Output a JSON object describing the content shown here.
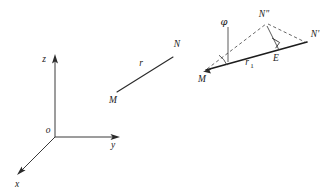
{
  "figure": {
    "background_color": "#ffffff",
    "ink_color": "#1c1c1c"
  },
  "panels": [
    {
      "id": "coordinate-axes",
      "name": "cartesian-coordinate-system",
      "labels": {
        "origin": "o",
        "z_axis": "z",
        "y_axis": "y",
        "x_axis": "x"
      }
    },
    {
      "id": "vector-segment",
      "name": "segment-m-n",
      "labels": {
        "start_point": "M",
        "end_point": "N",
        "segment": "r"
      }
    },
    {
      "id": "projection-triangle",
      "name": "triangle-m-nprime-ndoubleprime",
      "labels": {
        "vertex_left": "M",
        "vertex_right": "N'",
        "vertex_top": "N″",
        "foot_point": "E",
        "angle": "φ",
        "base_segment_letter": "r",
        "base_segment_subscript": "1"
      }
    }
  ],
  "axis_labels": {
    "origin": "o",
    "z": "z",
    "y": "y",
    "x": "x"
  },
  "segment_labels": {
    "m": "M",
    "n": "N",
    "r": "r"
  },
  "triangle_labels": {
    "m": "M",
    "n_prime": "N'",
    "n_double_prime": "N″",
    "e": "E",
    "phi": "φ",
    "r1_letter": "r",
    "r1_subscript": "1"
  }
}
